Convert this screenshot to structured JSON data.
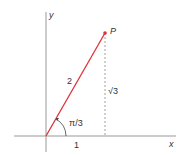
{
  "diagram": {
    "labels": {
      "y_axis": "y",
      "x_axis": "x",
      "point": "P",
      "hypotenuse": "2",
      "opposite": "√3",
      "angle": "π/3",
      "adjacent": "1"
    },
    "colors": {
      "segment": "#e0303a",
      "point": "#e0303a",
      "axes": "#888888",
      "dashed": "#888888",
      "text": "#333333"
    }
  }
}
